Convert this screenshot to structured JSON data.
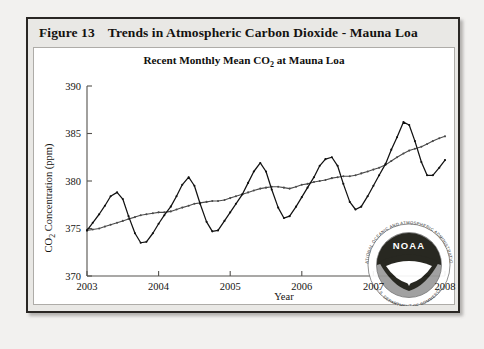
{
  "figure": {
    "number_label": "Figure 13",
    "title": "Trends in Atmospheric Carbon Dioxide - Mauna Loa"
  },
  "watermark": {
    "name": "noaa-logo",
    "wordmark": "NOAA",
    "ring_top_text": "NATIONAL OCEANIC AND ATMOSPHERIC ADMINISTRATION",
    "ring_bottom_text": "U.S. DEPARTMENT OF COMMERCE"
  },
  "colors": {
    "monthly": "#111111",
    "trend": "#4a4a4a",
    "axis": "#55524e",
    "panel_background": "#ffffff",
    "frame_background": "#e9e8e5",
    "frame_border": "#2a2724"
  },
  "chart_data": {
    "type": "line",
    "title": "Recent Monthly Mean CO2 at Mauna Loa",
    "title_html": "Recent Monthly Mean CO<sub>2</sub> at Mauna Loa",
    "xlabel": "Year",
    "ylabel": "CO2 Concentration (ppm)",
    "ylabel_html": "CO<sub>2</sub> Concentration (ppm)",
    "xlim": [
      2003.0,
      2008.0
    ],
    "ylim": [
      370,
      390
    ],
    "xticks": [
      2003,
      2004,
      2005,
      2006,
      2007,
      2008
    ],
    "xticklabels": [
      "2003",
      "2004",
      "2005",
      "2006",
      "2007",
      "2008"
    ],
    "yticks": [
      370,
      375,
      380,
      385,
      390
    ],
    "yticklabels": [
      "370",
      "375",
      "380",
      "385",
      "390"
    ],
    "grid": false,
    "legend": false,
    "x": [
      2003.0,
      2003.08,
      2003.17,
      2003.25,
      2003.33,
      2003.42,
      2003.5,
      2003.58,
      2003.67,
      2003.75,
      2003.83,
      2003.92,
      2004.0,
      2004.08,
      2004.17,
      2004.25,
      2004.33,
      2004.42,
      2004.5,
      2004.58,
      2004.67,
      2004.75,
      2004.83,
      2004.92,
      2005.0,
      2005.08,
      2005.17,
      2005.25,
      2005.33,
      2005.42,
      2005.5,
      2005.58,
      2005.67,
      2005.75,
      2005.83,
      2005.92,
      2006.0,
      2006.08,
      2006.17,
      2006.25,
      2006.33,
      2006.42,
      2006.5,
      2006.58,
      2006.67,
      2006.75,
      2006.83,
      2006.92,
      2007.0,
      2007.08,
      2007.17,
      2007.25,
      2007.33,
      2007.42,
      2007.5,
      2007.58,
      2007.67,
      2007.75,
      2007.83,
      2007.92,
      2008.0
    ],
    "series": [
      {
        "name": "Monthly mean CO2",
        "style": "jagged-seasonal",
        "color": "#111111",
        "values": [
          374.8,
          375.6,
          376.5,
          377.4,
          378.4,
          378.8,
          378.1,
          376.3,
          374.5,
          373.5,
          373.6,
          374.5,
          375.5,
          376.4,
          377.3,
          378.4,
          379.6,
          380.4,
          379.5,
          377.6,
          375.7,
          374.7,
          374.8,
          375.8,
          376.7,
          377.6,
          378.6,
          379.8,
          381.0,
          381.9,
          381.0,
          379.1,
          377.2,
          376.1,
          376.3,
          377.3,
          378.3,
          379.3,
          380.4,
          381.6,
          382.3,
          382.5,
          381.6,
          379.7,
          377.8,
          377.0,
          377.3,
          378.4,
          379.5,
          380.6,
          381.8,
          383.3,
          384.6,
          386.2,
          385.9,
          384.2,
          382.0,
          380.6,
          380.6,
          381.4,
          382.2
        ]
      },
      {
        "name": "Trend (seasonally corrected)",
        "style": "smooth-trend",
        "color": "#4a4a4a",
        "values": [
          374.8,
          374.9,
          375.0,
          375.2,
          375.4,
          375.6,
          375.8,
          376.0,
          376.2,
          376.4,
          376.5,
          376.6,
          376.7,
          376.7,
          376.8,
          377.0,
          377.2,
          377.4,
          377.6,
          377.7,
          377.8,
          377.9,
          377.9,
          378.0,
          378.2,
          378.4,
          378.6,
          378.8,
          379.0,
          379.2,
          379.3,
          379.4,
          379.4,
          379.3,
          379.2,
          379.4,
          379.6,
          379.7,
          379.9,
          380.0,
          380.1,
          380.3,
          380.4,
          380.5,
          380.5,
          380.6,
          380.8,
          381.0,
          381.2,
          381.4,
          381.7,
          382.1,
          382.5,
          382.9,
          383.2,
          383.4,
          383.6,
          383.9,
          384.2,
          384.5,
          384.7
        ]
      }
    ]
  }
}
